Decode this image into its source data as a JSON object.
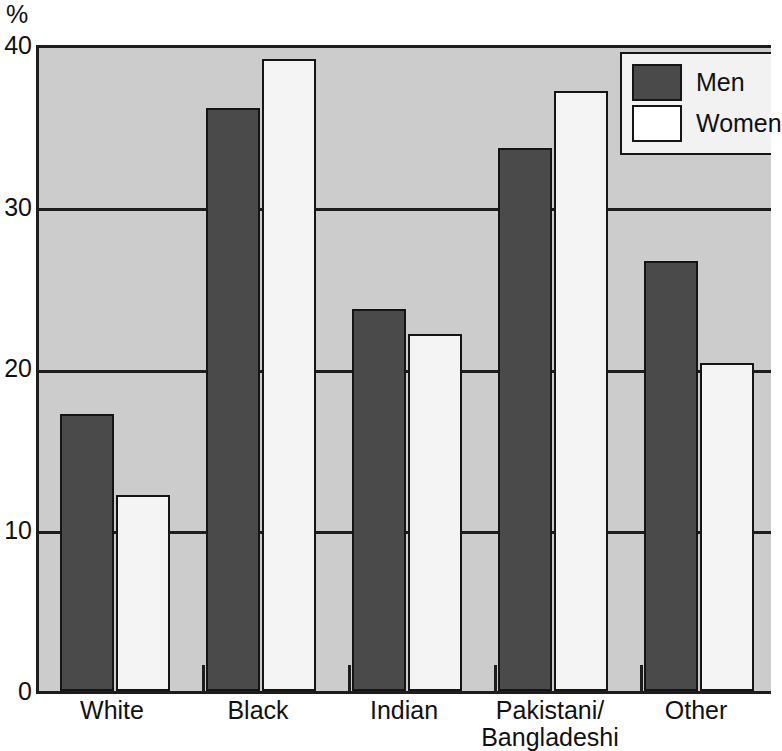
{
  "chart_data": {
    "type": "bar",
    "title": "",
    "subtitle": "",
    "xlabel": "",
    "ylabel": "%",
    "ylim": [
      0,
      40
    ],
    "yticks": [
      0,
      10,
      20,
      30,
      40
    ],
    "ytick_labels": [
      "0",
      "10",
      "20",
      "30",
      "40"
    ],
    "grid": true,
    "grid_axis": "y",
    "legend_position": "top-right",
    "categories": [
      "White",
      "Black",
      "Indian",
      "Pakistani/\nBangladeshi",
      "Other"
    ],
    "series": [
      {
        "name": "Men",
        "color": "#4a4a4a",
        "values": [
          17,
          36,
          23.5,
          33.5,
          26.5
        ]
      },
      {
        "name": "Women",
        "color": "#f4f4f4",
        "values": [
          12,
          39,
          22,
          37,
          20.2
        ]
      }
    ]
  },
  "axis": {
    "unit_label": "%"
  },
  "legend": {
    "items": [
      {
        "label": "Men",
        "swatch": "men"
      },
      {
        "label": "Women",
        "swatch": "women"
      }
    ]
  },
  "colors": {
    "plot_background": "#cccccc",
    "axis": "#1d1d1d",
    "men_bar": "#4a4a4a",
    "women_bar": "#f4f4f4",
    "legend_background": "#f2f2f2",
    "text": "#111111"
  }
}
